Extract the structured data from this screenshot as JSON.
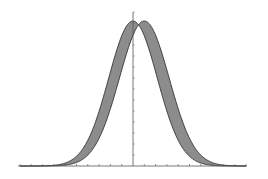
{
  "chart_data": {
    "type": "area",
    "title": "",
    "xlabel": "",
    "ylabel": "",
    "xlim": [
      -10,
      10
    ],
    "ylim": [
      0,
      1
    ],
    "grid": false,
    "legend": null,
    "x_ticks_every": 1,
    "y_axis_at_x": 0,
    "series": [
      {
        "name": "curve A (left)",
        "kind": "gaussian",
        "mu": 0.0,
        "sigma": 2.15,
        "peak": 1.0
      },
      {
        "name": "curve B (right)",
        "kind": "gaussian",
        "mu": 1.0,
        "sigma": 2.2,
        "peak": 1.0
      }
    ],
    "fill_between": {
      "series": [
        "curve A (left)",
        "curve B (right)"
      ],
      "color": "#8c8c8c"
    },
    "line_color": "#333333",
    "axis_color": "#555555"
  },
  "layout": {
    "origin_px": [
      133,
      166
    ],
    "px_per_x_unit": 11.3,
    "px_per_y_unit": 145,
    "y_axis_top_px": 12
  }
}
